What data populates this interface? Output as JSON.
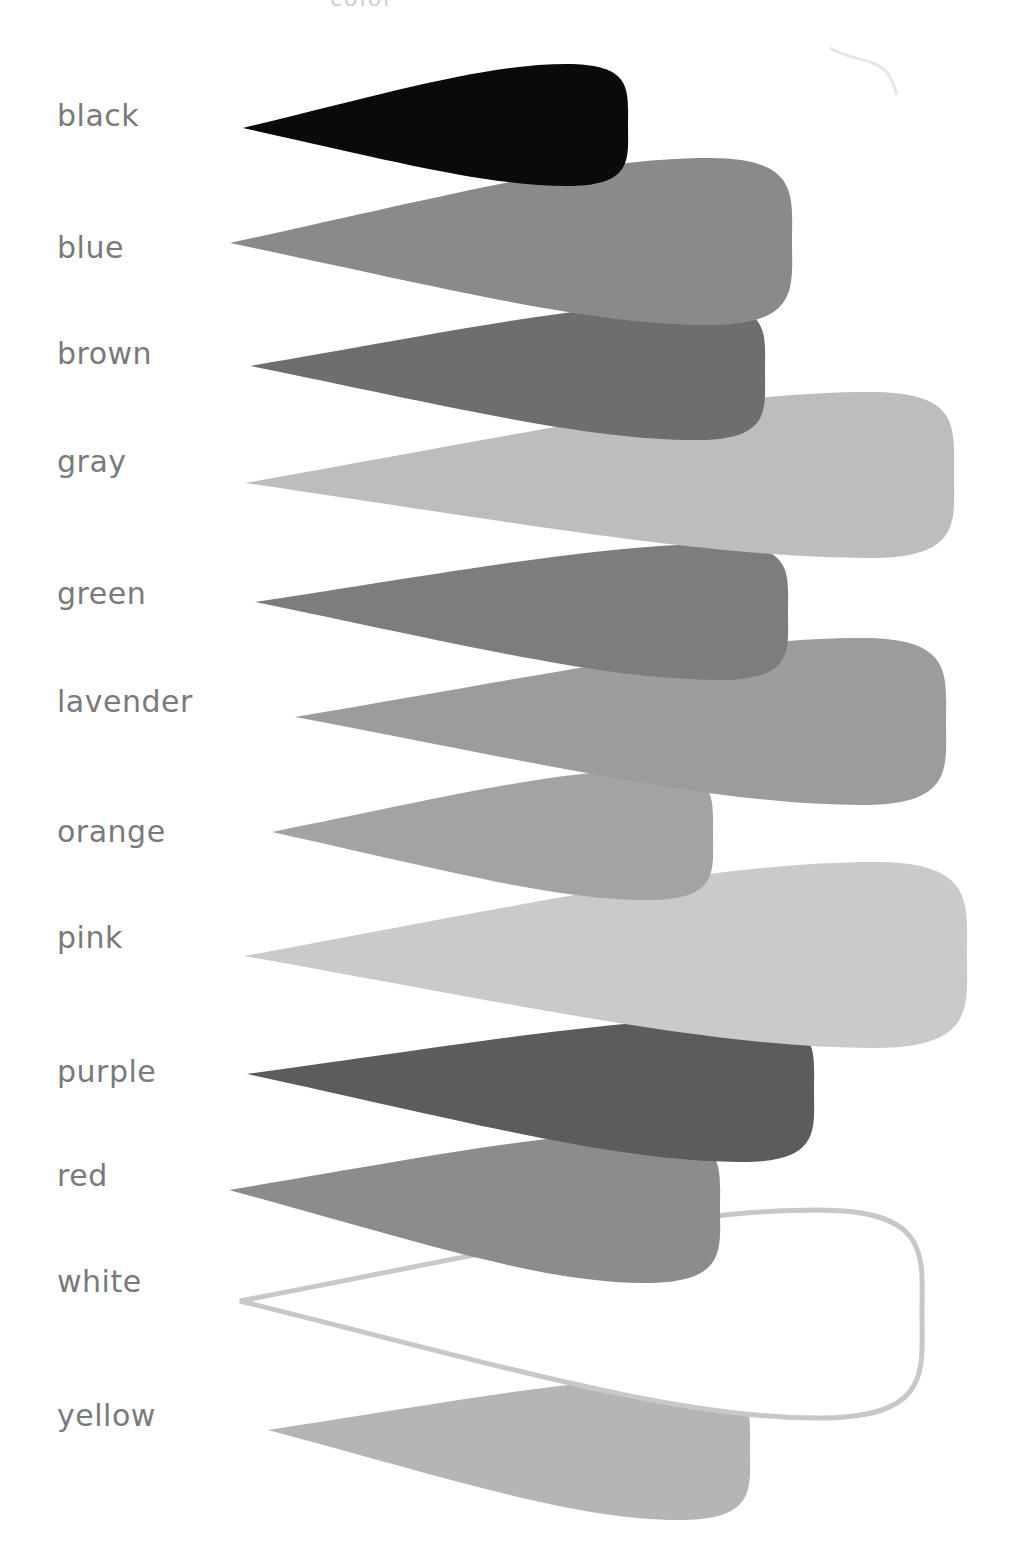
{
  "title_fragment": "color",
  "swatches": [
    {
      "label": "black",
      "label_y": 98,
      "fill": "#0a0a0a",
      "tip": [
        243,
        128
      ],
      "right": 628,
      "top": 64,
      "bottom": 186
    },
    {
      "label": "blue",
      "label_y": 230,
      "fill": "#8a8a8a",
      "tip": [
        230,
        243
      ],
      "right": 792,
      "top": 158,
      "bottom": 325
    },
    {
      "label": "brown",
      "label_y": 336,
      "fill": "#6e6e6e",
      "tip": [
        250,
        366
      ],
      "right": 765,
      "top": 303,
      "bottom": 440
    },
    {
      "label": "gray",
      "label_y": 444,
      "fill": "#bdbdbd",
      "tip": [
        245,
        483
      ],
      "right": 954,
      "top": 392,
      "bottom": 558
    },
    {
      "label": "green",
      "label_y": 576,
      "fill": "#7d7d7d",
      "tip": [
        255,
        602
      ],
      "right": 788,
      "top": 544,
      "bottom": 680
    },
    {
      "label": "lavender",
      "label_y": 684,
      "fill": "#9c9c9c",
      "tip": [
        295,
        717
      ],
      "right": 946,
      "top": 638,
      "bottom": 805
    },
    {
      "label": "orange",
      "label_y": 814,
      "fill": "#a3a3a3",
      "tip": [
        272,
        832
      ],
      "right": 713,
      "top": 770,
      "bottom": 900
    },
    {
      "label": "pink",
      "label_y": 920,
      "fill": "#cacaca",
      "tip": [
        244,
        956
      ],
      "right": 967,
      "top": 862,
      "bottom": 1048
    },
    {
      "label": "purple",
      "label_y": 1054,
      "fill": "#5c5c5c",
      "tip": [
        247,
        1074
      ],
      "right": 814,
      "top": 1018,
      "bottom": 1162
    },
    {
      "label": "red",
      "label_y": 1158,
      "fill": "#8c8c8c",
      "tip": [
        229,
        1190
      ],
      "right": 720,
      "top": 1133,
      "bottom": 1283
    },
    {
      "label": "white",
      "label_y": 1264,
      "fill": "#ffffff",
      "stroke": "#c8c8c8",
      "tip": [
        240,
        1301
      ],
      "right": 922,
      "top": 1210,
      "bottom": 1418
    },
    {
      "label": "yellow",
      "label_y": 1398,
      "fill": "#b5b5b5",
      "tip": [
        268,
        1430
      ],
      "right": 750,
      "top": 1378,
      "bottom": 1520
    }
  ],
  "draw_order": [
    "yellow",
    "white",
    "red",
    "purple",
    "pink",
    "orange",
    "lavender",
    "green",
    "gray",
    "brown",
    "blue",
    "black"
  ]
}
